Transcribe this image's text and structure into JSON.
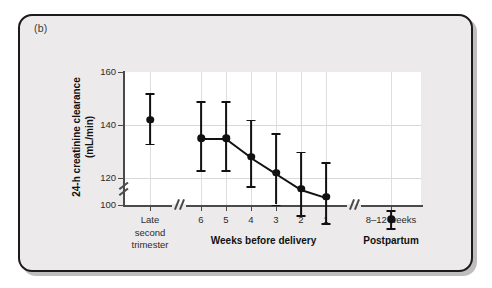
{
  "panel": {
    "label": "(b)"
  },
  "chart_data": {
    "type": "scatter",
    "title": "",
    "xlabel": "",
    "ylabel": "24-h creatinine clearance (mL/min)",
    "ylabel_line1": "24-h creatinine clearance",
    "ylabel_line2": "(mL/min)",
    "ylim": [
      100,
      160
    ],
    "yticks": [
      100,
      120,
      140,
      160
    ],
    "ytick_labels": [
      "100",
      "120",
      "140",
      "160"
    ],
    "y_axis_break": true,
    "y_axis_break_between": [
      100,
      120
    ],
    "grid": "horizontal-and-vertical",
    "legend": "none",
    "x_axis_breaks": 2,
    "groups": [
      {
        "name": "Late second trimester",
        "group_label": "",
        "tick_labels": [
          "Late",
          "second",
          "trimester"
        ],
        "points": [
          {
            "x": "Late second trimester",
            "y": 142,
            "low": 133,
            "high": 152
          }
        ]
      },
      {
        "name": "Weeks before delivery",
        "group_label": "Weeks before delivery",
        "tick_labels": [
          "6",
          "5",
          "4",
          "3",
          "2",
          "1"
        ],
        "connected": true,
        "points": [
          {
            "x": "6",
            "y": 135,
            "low": 123,
            "high": 149
          },
          {
            "x": "5",
            "y": 135,
            "low": 123,
            "high": 149
          },
          {
            "x": "4",
            "y": 128,
            "low": 117,
            "high": 142
          },
          {
            "x": "3",
            "y": 122,
            "low": 110,
            "high": 137
          },
          {
            "x": "2",
            "y": 116,
            "low": 106,
            "high": 130
          },
          {
            "x": "1",
            "y": 113,
            "low": 103,
            "high": 126
          }
        ]
      },
      {
        "name": "Postpartum",
        "group_label": "Postpartum",
        "tick_labels": [
          "8–12 weeks"
        ],
        "points": [
          {
            "x": "8–12 weeks",
            "y": 104.5,
            "low": 101,
            "high": 108
          }
        ]
      }
    ]
  },
  "colors": {
    "marker": "#111111",
    "axis": "#4a4a4a",
    "grid": "#d9d9d9",
    "panel_bg": "#eceaea",
    "plot_bg": "#ffffff",
    "frame": "#1b1b1b"
  }
}
